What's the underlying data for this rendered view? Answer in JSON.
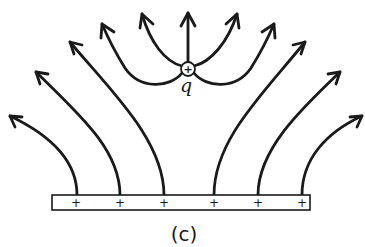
{
  "figure": {
    "caption": "(c)",
    "point_charge": {
      "label": "q",
      "sign": "+",
      "position": [
        188,
        69
      ]
    },
    "plate": {
      "charge_signs": [
        "+",
        "+",
        "+",
        "+",
        "+",
        "+"
      ],
      "sign_positions_x": [
        76,
        120,
        164,
        214,
        258,
        302
      ]
    },
    "field_lines": [
      {
        "id": "plate-1",
        "from": "plate",
        "direction": "up-left"
      },
      {
        "id": "plate-2",
        "from": "plate",
        "direction": "up-left"
      },
      {
        "id": "plate-3",
        "from": "plate",
        "direction": "up-left"
      },
      {
        "id": "plate-4",
        "from": "plate",
        "direction": "up-right"
      },
      {
        "id": "plate-5",
        "from": "plate",
        "direction": "up-right"
      },
      {
        "id": "plate-6",
        "from": "plate",
        "direction": "up-right"
      },
      {
        "id": "charge-center",
        "from": "charge",
        "direction": "up"
      },
      {
        "id": "charge-upper-left",
        "from": "charge",
        "direction": "up-left"
      },
      {
        "id": "charge-lower-left",
        "from": "charge",
        "direction": "up-left"
      },
      {
        "id": "charge-upper-right",
        "from": "charge",
        "direction": "up-right"
      },
      {
        "id": "charge-lower-right",
        "from": "charge",
        "direction": "up-right"
      }
    ],
    "colors": {
      "ink": "#1a1a1a",
      "background": "#ffffff"
    }
  }
}
